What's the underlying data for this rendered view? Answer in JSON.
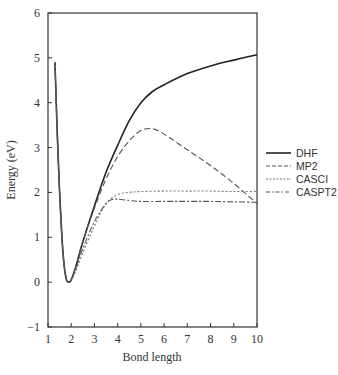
{
  "chart_data": {
    "type": "line",
    "title": "",
    "xlabel": "Bond length",
    "ylabel": "Energy (eV)",
    "xlim": [
      1,
      10
    ],
    "ylim": [
      -1,
      6
    ],
    "xticks": [
      1,
      2,
      3,
      4,
      5,
      6,
      7,
      8,
      9,
      10
    ],
    "yticks": [
      -1,
      0,
      1,
      2,
      3,
      4,
      5,
      6
    ],
    "grid": false,
    "legend_position": "right-outside",
    "series": [
      {
        "name": "DHF",
        "style": "solid",
        "color": "#222222",
        "width": 1.6,
        "x": [
          1.3,
          1.4,
          1.5,
          1.6,
          1.7,
          1.8,
          1.9,
          2.0,
          2.2,
          2.5,
          3.0,
          3.5,
          4.0,
          4.5,
          5.0,
          5.5,
          6.0,
          7.0,
          8.0,
          9.0,
          10.0
        ],
        "y": [
          4.9,
          3.3,
          2.0,
          1.0,
          0.35,
          0.05,
          0.0,
          0.05,
          0.35,
          0.9,
          1.7,
          2.45,
          3.05,
          3.6,
          4.0,
          4.25,
          4.4,
          4.65,
          4.82,
          4.95,
          5.07
        ]
      },
      {
        "name": "MP2",
        "style": "dashed",
        "color": "#555555",
        "width": 1.1,
        "x": [
          1.3,
          1.4,
          1.5,
          1.6,
          1.7,
          1.8,
          1.9,
          2.0,
          2.2,
          2.5,
          3.0,
          3.5,
          4.0,
          4.5,
          5.0,
          5.5,
          6.0,
          7.0,
          8.0,
          9.0,
          10.0
        ],
        "y": [
          4.9,
          3.3,
          2.0,
          1.0,
          0.35,
          0.05,
          0.0,
          0.05,
          0.35,
          0.9,
          1.65,
          2.3,
          2.8,
          3.15,
          3.38,
          3.42,
          3.3,
          2.95,
          2.6,
          2.2,
          1.75
        ]
      },
      {
        "name": "CASCI",
        "style": "dotted",
        "color": "#777777",
        "width": 1.1,
        "x": [
          1.3,
          1.4,
          1.5,
          1.6,
          1.7,
          1.8,
          1.9,
          2.0,
          2.2,
          2.5,
          3.0,
          3.5,
          4.0,
          4.5,
          5.0,
          6.0,
          7.0,
          8.0,
          9.0,
          10.0
        ],
        "y": [
          4.9,
          3.3,
          2.0,
          1.0,
          0.35,
          0.05,
          0.0,
          0.05,
          0.25,
          0.65,
          1.25,
          1.75,
          1.95,
          2.0,
          2.02,
          2.03,
          2.03,
          2.03,
          2.02,
          2.02
        ]
      },
      {
        "name": "CASPT2",
        "style": "dashdot",
        "color": "#555555",
        "width": 1.1,
        "x": [
          1.3,
          1.4,
          1.5,
          1.6,
          1.7,
          1.8,
          1.9,
          2.0,
          2.2,
          2.5,
          3.0,
          3.5,
          3.8,
          4.0,
          4.5,
          5.0,
          6.0,
          7.0,
          8.0,
          9.0,
          10.0
        ],
        "y": [
          4.9,
          3.3,
          2.0,
          1.0,
          0.35,
          0.05,
          0.0,
          0.05,
          0.3,
          0.75,
          1.35,
          1.75,
          1.85,
          1.85,
          1.82,
          1.8,
          1.8,
          1.8,
          1.8,
          1.79,
          1.78
        ]
      }
    ]
  },
  "legend": {
    "items": [
      {
        "label": "DHF"
      },
      {
        "label": "MP2"
      },
      {
        "label": "CASCI"
      },
      {
        "label": "CASPT2"
      }
    ]
  }
}
